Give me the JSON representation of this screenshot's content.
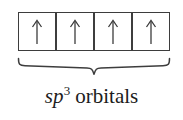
{
  "figure": {
    "name": "sp3-hybrid-orbital-diagram",
    "background_color": "#ffffff",
    "line_color": "#3d3d3d",
    "text_color": "#1c1c1c"
  },
  "orbital_boxes": {
    "count": 4,
    "electron_glyph": "up-arrow",
    "cells": [
      {
        "label": "↑",
        "electron": "up-arrow",
        "occupancy": 1
      },
      {
        "label": "↑",
        "electron": "up-arrow",
        "occupancy": 1
      },
      {
        "label": "↑",
        "electron": "up-arrow",
        "occupancy": 1
      },
      {
        "label": "↑",
        "electron": "up-arrow",
        "occupancy": 1
      }
    ]
  },
  "brace": {
    "orientation": "down",
    "spans_boxes": 4
  },
  "caption": {
    "full_text": "sp3 orbitals",
    "symbol": "sp",
    "superscript": "3",
    "word": "orbitals"
  }
}
